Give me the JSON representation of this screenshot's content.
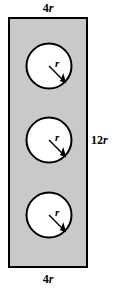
{
  "figure": {
    "name": "rectangle-with-three-inscribed-circles",
    "background_color": "#ffffff",
    "rectangle": {
      "name": "shaded-rectangle",
      "fill_color": "#c9c9c9",
      "stroke_color": "#000000",
      "stroke_width": 2,
      "x": 8,
      "y": 17,
      "width": 80,
      "height": 251,
      "width_label": "4r",
      "height_label": "12r"
    },
    "labels": {
      "top": {
        "prefix": "4",
        "variable": "r"
      },
      "bottom": {
        "prefix": "4",
        "variable": "r"
      },
      "right": {
        "prefix": "12",
        "variable": "r"
      }
    },
    "circles": [
      {
        "name": "circle-top",
        "cx": 49,
        "cy": 66,
        "r": 23,
        "fill_color": "#ffffff",
        "stroke_color": "#000000",
        "stroke_width": 2,
        "radius_label": "r",
        "arrow": {
          "x1": 49,
          "y1": 66,
          "x2": 65.3,
          "y2": 82.3
        }
      },
      {
        "name": "circle-middle",
        "cx": 49,
        "cy": 140,
        "r": 23,
        "fill_color": "#ffffff",
        "stroke_color": "#000000",
        "stroke_width": 2,
        "radius_label": "r",
        "arrow": {
          "x1": 49,
          "y1": 140,
          "x2": 65.3,
          "y2": 156.3
        }
      },
      {
        "name": "circle-bottom",
        "cx": 49,
        "cy": 215,
        "r": 23,
        "fill_color": "#ffffff",
        "stroke_color": "#000000",
        "stroke_width": 2,
        "radius_label": "r",
        "arrow": {
          "x1": 49,
          "y1": 215,
          "x2": 65.3,
          "y2": 231.3
        }
      }
    ]
  }
}
